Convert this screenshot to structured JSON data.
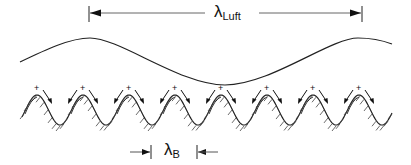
{
  "diagram": {
    "labels": {
      "air_wavelength": {
        "symbol": "λ",
        "subscript": "Luft"
      },
      "structure_wavelength": {
        "symbol": "λ",
        "subscript": "B"
      }
    },
    "markers": {
      "charge_sign": "+"
    },
    "colors": {
      "stroke": "#222222",
      "dimension_line": "#555555",
      "background": "#ffffff"
    },
    "structure_wave": {
      "peaks": 8,
      "period_px": 46,
      "hatched": true
    }
  }
}
